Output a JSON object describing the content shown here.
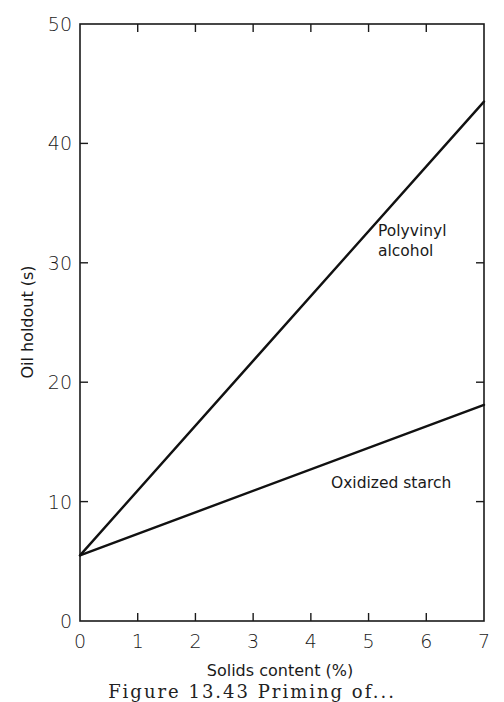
{
  "chart_data": {
    "type": "line",
    "title": "",
    "xlabel": "Solids content (%)",
    "ylabel": "Oil holdout (s)",
    "xlim": [
      0,
      7
    ],
    "ylim": [
      0,
      50
    ],
    "x_ticks": [
      0,
      1,
      2,
      3,
      4,
      5,
      6,
      7
    ],
    "y_ticks": [
      0,
      10,
      20,
      30,
      40,
      50
    ],
    "x_tick_labels": [
      "0",
      "1",
      "2",
      "3",
      "4",
      "5",
      "6",
      "7"
    ],
    "y_tick_labels": [
      "0",
      "10",
      "20",
      "30",
      "40",
      "50"
    ],
    "grid": false,
    "legend": "inline labels",
    "series": [
      {
        "name": "Polyvinyl alcohol",
        "label_lines": [
          "Polyvinyl",
          "alcohol"
        ],
        "x": [
          0,
          7
        ],
        "y": [
          5.5,
          43.5
        ]
      },
      {
        "name": "Oxidized starch",
        "label_lines": [
          "Oxidized starch"
        ],
        "x": [
          0,
          7
        ],
        "y": [
          5.5,
          18.1
        ]
      }
    ]
  },
  "caption": "Figure 13.43   Priming of..."
}
